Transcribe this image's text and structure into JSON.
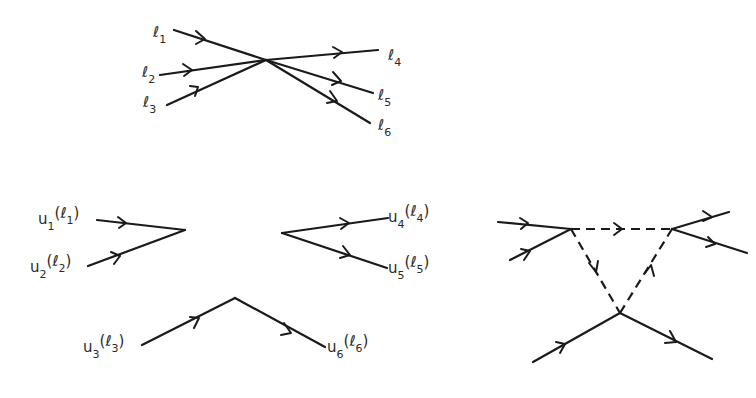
{
  "figure": {
    "colors": {
      "ink": "#1a1a1a",
      "background": "#ffffff"
    }
  },
  "top_vertex": {
    "labels": [
      {
        "main": "ℓ",
        "sub": "1"
      },
      {
        "main": "ℓ",
        "sub": "2"
      },
      {
        "main": "ℓ",
        "sub": "3"
      },
      {
        "main": "ℓ",
        "sub": "4"
      },
      {
        "main": "ℓ",
        "sub": "5"
      },
      {
        "main": "ℓ",
        "sub": "6"
      }
    ]
  },
  "split_diagram": {
    "labels": [
      {
        "u": "u",
        "usub": "1",
        "l": "ℓ",
        "lsub": "1"
      },
      {
        "u": "u",
        "usub": "2",
        "l": "ℓ",
        "lsub": "2"
      },
      {
        "u": "u",
        "usub": "3",
        "l": "ℓ",
        "lsub": "3"
      },
      {
        "u": "u",
        "usub": "4",
        "l": "ℓ",
        "lsub": "4"
      },
      {
        "u": "u",
        "usub": "5",
        "l": "ℓ",
        "lsub": "5"
      },
      {
        "u": "u",
        "usub": "6",
        "l": "ℓ",
        "lsub": "6"
      }
    ]
  },
  "loop_diagram": {
    "vertices": 3,
    "internal_lines": "dashed"
  }
}
